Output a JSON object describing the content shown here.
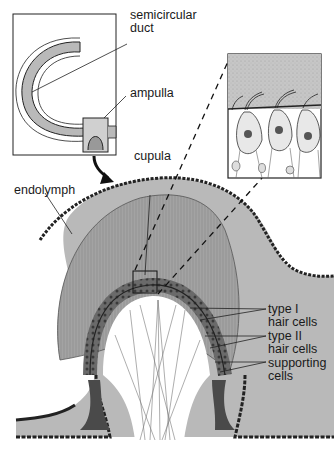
{
  "diagram": {
    "colors": {
      "background": "#ffffff",
      "endolymph_fill": "#b9b9b9",
      "cupula_fill": "#9a9a9a",
      "line": "#1a1a1a",
      "epithelium": "#555555",
      "inset_fill": "#c4c4c4"
    },
    "labels": {
      "semicircular_duct_1": "semicircular",
      "semicircular_duct_2": "duct",
      "ampulla": "ampulla",
      "cupula": "cupula",
      "endolymph": "endolymph",
      "type1_1": "type I",
      "type1_2": "hair cells",
      "type2_1": "type II",
      "type2_2": "hair cells",
      "supporting_1": "supporting",
      "supporting_2": "cells"
    },
    "panels": {
      "overview_inset": "semicircular duct and ampulla overview",
      "magnified_inset": "magnified view of hair cells beneath cupula",
      "main": "cross-section of crista ampullaris"
    }
  }
}
